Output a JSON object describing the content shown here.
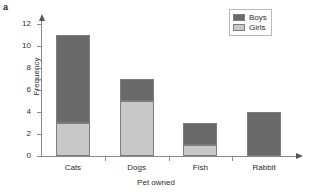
{
  "panel": {
    "label": "a"
  },
  "chart_data": {
    "type": "bar",
    "subtype": "stacked-bar",
    "title": "",
    "xlabel": "Pet owned",
    "ylabel": "Frequency",
    "categories": [
      "Cats",
      "Dogs",
      "Fish",
      "Rabbit"
    ],
    "series": [
      {
        "name": "Girls",
        "values": [
          3,
          5,
          1,
          0
        ],
        "color": "#c8c8c8"
      },
      {
        "name": "Boys",
        "values": [
          8,
          2,
          2,
          4
        ],
        "color": "#6a6a6a"
      }
    ],
    "totals": [
      11,
      7,
      3,
      4
    ],
    "ylim": [
      0,
      12
    ],
    "yticks": [
      0,
      2,
      4,
      6,
      8,
      10,
      12
    ],
    "ytick_labels": [
      "0",
      "2",
      "4",
      "6",
      "8",
      "10",
      "12"
    ],
    "grid": false,
    "legend_position": "top-right",
    "legend_entries": [
      "Boys",
      "Girls"
    ],
    "axis_arrows": true
  },
  "legend": {
    "rows": [
      {
        "label": "Boys",
        "color": "#6a6a6a"
      },
      {
        "label": "Girls",
        "color": "#c8c8c8"
      }
    ]
  },
  "colors": {
    "boys": "#6a6a6a",
    "girls": "#c8c8c8",
    "axis": "#8a8a8a",
    "text": "#2b2b2b",
    "bar_border": "#7d7d7d",
    "legend_border": "#b9b9b9",
    "background": "#ffffff"
  }
}
